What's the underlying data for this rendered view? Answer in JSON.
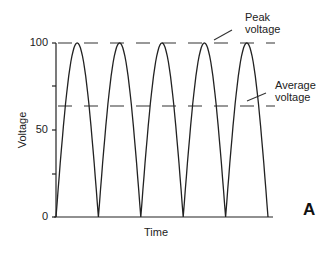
{
  "chart_data": {
    "type": "line",
    "title": "",
    "xlabel": "Time",
    "ylabel": "Voltage",
    "ylim": [
      0,
      100
    ],
    "yticks": [
      0,
      25,
      50,
      75,
      100
    ],
    "ytick_labels": [
      "0",
      "",
      "50",
      "",
      "100"
    ],
    "grid": false,
    "series": [
      {
        "name": "Full-wave rectified voltage",
        "description": "Five half-sine arches (|sin|) peaking at 100",
        "cycles": 5,
        "peak": 100,
        "minimum": 0
      },
      {
        "name": "Peak voltage",
        "style": "dashed",
        "value": 100
      },
      {
        "name": "Average voltage",
        "style": "dashed",
        "value": 63.7
      }
    ],
    "annotations": [
      {
        "text": "Peak voltage",
        "target": "Peak voltage line"
      },
      {
        "text": "Average voltage",
        "target": "Average voltage line"
      }
    ],
    "panel_label": "A"
  },
  "labels": {
    "peak_line1": "Peak",
    "peak_line2": "voltage",
    "avg_line1": "Average",
    "avg_line2": "voltage",
    "y100": "100",
    "y50": "50",
    "y0": "0",
    "ylabel": "Voltage",
    "xlabel": "Time",
    "panel": "A"
  }
}
